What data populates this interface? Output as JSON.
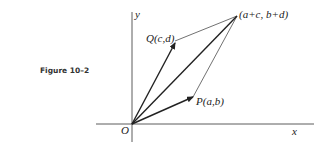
{
  "caption": "Figure 10–2",
  "axes": {
    "x_label": "x",
    "y_label": "y",
    "origin_label": "O"
  },
  "points": {
    "P": "P(a,b)",
    "Q": "Q(c,d)",
    "sum": "(a+c, b+d)"
  },
  "colors": {
    "ink": "#222222",
    "background": "#ffffff"
  }
}
